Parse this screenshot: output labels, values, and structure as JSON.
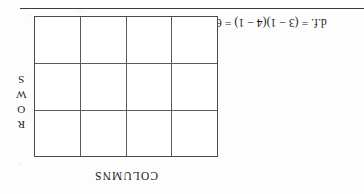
{
  "figure": {
    "type": "contingency-table-diagram",
    "orientation": "upside-down-scan",
    "formula": "d.f. = (3 − 1)(4 − 1) = 6",
    "rows_label": "ROWS",
    "rows_label_letters": [
      "R",
      "O",
      "W",
      "S"
    ],
    "columns_label": "COLUMNS",
    "grid": {
      "rows": 3,
      "columns": 4,
      "cells": [
        [
          "",
          "",
          "",
          ""
        ],
        [
          "",
          "",
          "",
          ""
        ],
        [
          "",
          "",
          "",
          ""
        ]
      ]
    }
  },
  "colors": {
    "ink": "#1b1b1b",
    "rule": "#3a3a3a",
    "grid_line": "#5a5a5a",
    "paper": "#fdfdfd"
  }
}
